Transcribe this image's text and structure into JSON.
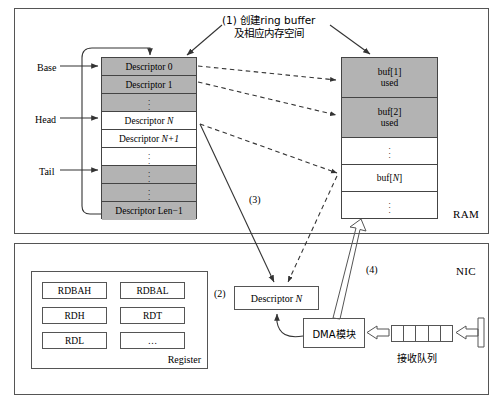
{
  "diagram": {
    "gray_fill": "#b3b3b3",
    "line_color": "#333333"
  },
  "panels": {
    "ram": {
      "label": "RAM"
    },
    "nic": {
      "label": "NIC"
    }
  },
  "annotations": {
    "step1_line1": "(1) 创建ring buffer",
    "step1_line2": "及相应内存空间",
    "step2": "(2)",
    "step3": "(3)",
    "step4": "(4)"
  },
  "pointers": [
    {
      "label": "Base",
      "target_row": 0
    },
    {
      "label": "Head",
      "target_row": 3
    },
    {
      "label": "Tail",
      "target_row": 6
    }
  ],
  "descriptor_ring": {
    "rows": [
      {
        "label": "Descriptor 0",
        "filled": true,
        "dots": false
      },
      {
        "label": "Descriptor 1",
        "filled": true,
        "dots": false
      },
      {
        "label": "",
        "filled": true,
        "dots": true
      },
      {
        "label": "Descriptor N",
        "filled": false,
        "dots": false,
        "italic_tail": "N"
      },
      {
        "label": "Descriptor N+1",
        "filled": false,
        "dots": false,
        "italic_tail": "N+1"
      },
      {
        "label": "",
        "filled": false,
        "dots": true
      },
      {
        "label": "",
        "filled": true,
        "dots": true
      },
      {
        "label": "",
        "filled": true,
        "dots": true
      },
      {
        "label": "Descriptor Len−1",
        "filled": true,
        "dots": false
      }
    ]
  },
  "ram_buffers": {
    "rows": [
      {
        "line1": "buf[1]",
        "line2": "used",
        "filled": true,
        "dots": false
      },
      {
        "line1": "buf[2]",
        "line2": "used",
        "filled": true,
        "dots": false
      },
      {
        "line1": "",
        "line2": "",
        "filled": false,
        "dots": true
      },
      {
        "line1": "buf[N]",
        "line2": "",
        "filled": false,
        "dots": false
      },
      {
        "line1": "",
        "line2": "",
        "filled": false,
        "dots": true
      }
    ]
  },
  "register_block": {
    "title": "Register",
    "registers": [
      "RDBAH",
      "RDBAL",
      "RDH",
      "RDT",
      "RDL",
      "…"
    ]
  },
  "nic_nodes": {
    "descriptor_n": "Descriptor N",
    "dma_module": "DMA模块",
    "receive_queue_label": "接收队列",
    "queue_cell_count": 5
  }
}
